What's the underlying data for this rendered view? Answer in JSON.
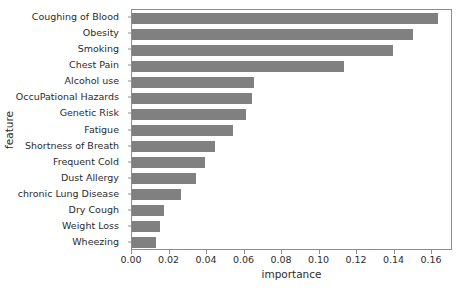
{
  "chart_data": {
    "type": "bar",
    "orientation": "horizontal",
    "title": "",
    "xlabel": "importance",
    "ylabel": "feature",
    "categories": [
      "Coughing of Blood",
      "Obesity",
      "Smoking",
      "Chest Pain",
      "Alcohol use",
      "OccuPational Hazards",
      "Genetic Risk",
      "Fatigue",
      "Shortness of Breath",
      "Frequent Cold",
      "Dust Allergy",
      "chronic Lung Disease",
      "Dry Cough",
      "Weight Loss",
      "Wheezing"
    ],
    "values": [
      0.163,
      0.15,
      0.139,
      0.113,
      0.065,
      0.064,
      0.061,
      0.054,
      0.044,
      0.039,
      0.034,
      0.026,
      0.017,
      0.015,
      0.013
    ],
    "xlim": [
      0.0,
      0.1712
    ],
    "ylim_categories": 15,
    "xticks": [
      0.0,
      0.02,
      0.04,
      0.06,
      0.08,
      0.1,
      0.12,
      0.14,
      0.16
    ],
    "xtick_labels": [
      "0.00",
      "0.02",
      "0.04",
      "0.06",
      "0.08",
      "0.10",
      "0.12",
      "0.14",
      "0.16"
    ],
    "grid": false,
    "legend": null,
    "bar_color": "#808080",
    "axis_color": "#8d8d8d",
    "text_color": "#2b2b2b",
    "background": "#ffffff"
  }
}
